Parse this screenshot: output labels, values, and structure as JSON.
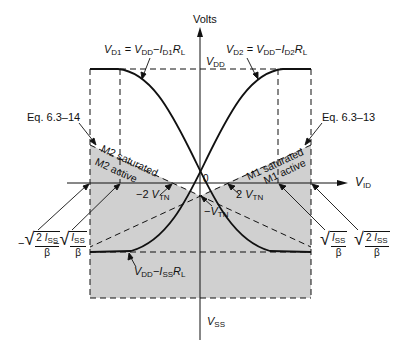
{
  "diagram": {
    "y_axis_label": "Volts",
    "x_axis_label_main": "V",
    "x_axis_label_sub": "ID",
    "origin_label": "0",
    "vdd_label": {
      "main": "V",
      "sub": "DD"
    },
    "vss_label": {
      "main": "V",
      "sub": "SS"
    },
    "vd1_label": {
      "a": "V",
      "a_sub": "D1",
      "eq": " = ",
      "b": "V",
      "b_sub": "DD",
      "minus": "−",
      "c": "I",
      "c_sub": "D1",
      "d": "R",
      "d_sub": "L"
    },
    "vd2_label": {
      "a": "V",
      "a_sub": "D2",
      "eq": " = ",
      "b": "V",
      "b_sub": "DD",
      "minus": "−",
      "c": "I",
      "c_sub": "D2",
      "d": "R",
      "d_sub": "L"
    },
    "vmin_label": {
      "b": "V",
      "b_sub": "DD",
      "minus": "−",
      "c": "I",
      "c_sub": "SS",
      "d": "R",
      "d_sub": "L"
    },
    "eq_left": "Eq. 6.3–14",
    "eq_right": "Eq. 6.3–13",
    "m2_saturated": "M2 saturated",
    "m2_active": "M2 active",
    "m1_saturated": "M1 saturated",
    "m1_active": "M1 active",
    "neg_2vtn": {
      "pre": "−2 ",
      "v": "V",
      "sub": "TN"
    },
    "pos_2vtn": {
      "pre": "2 ",
      "v": "V",
      "sub": "TN"
    },
    "neg_vtn": {
      "pre": "−",
      "v": "V",
      "sub": "TN"
    },
    "ticks": {
      "neg_outer": {
        "sign": "−",
        "num_a": "2",
        "num_i": "I",
        "num_sub": "SS",
        "den": "β"
      },
      "neg_inner": {
        "sign": "−",
        "num_a": "",
        "num_i": "I",
        "num_sub": "SS",
        "den": "β"
      },
      "pos_inner": {
        "sign": "",
        "num_a": "",
        "num_i": "I",
        "num_sub": "SS",
        "den": "β"
      },
      "pos_outer": {
        "sign": "",
        "num_a": "2",
        "num_i": "I",
        "num_sub": "SS",
        "den": "β"
      }
    },
    "colors": {
      "shade": "#d0d0d0",
      "line": "#111111"
    }
  }
}
